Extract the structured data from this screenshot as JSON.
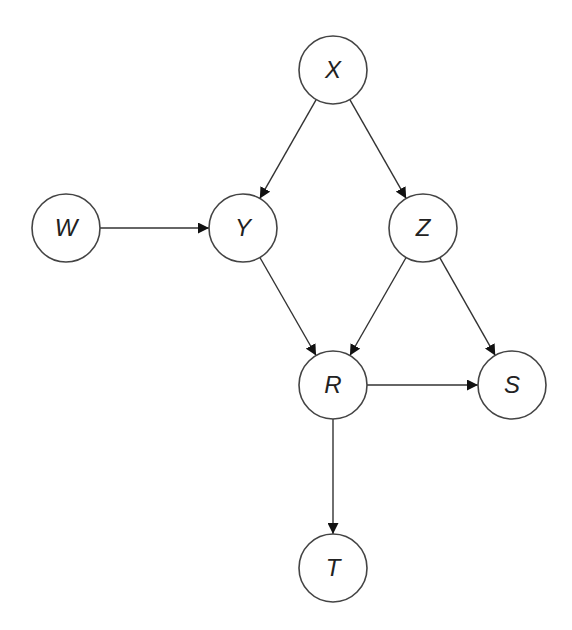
{
  "diagram": {
    "type": "directed-acyclic-graph",
    "node_radius": 34,
    "colors": {
      "node_stroke": "#444444",
      "node_fill": "#ffffff",
      "edge": "#333333",
      "label": "#222222"
    },
    "nodes": [
      {
        "id": "X",
        "label": "X",
        "cx": 333,
        "cy": 70
      },
      {
        "id": "W",
        "label": "W",
        "cx": 66,
        "cy": 228
      },
      {
        "id": "Y",
        "label": "Y",
        "cx": 243,
        "cy": 228
      },
      {
        "id": "Z",
        "label": "Z",
        "cx": 423,
        "cy": 228
      },
      {
        "id": "R",
        "label": "R",
        "cx": 333,
        "cy": 385
      },
      {
        "id": "S",
        "label": "S",
        "cx": 512,
        "cy": 385
      },
      {
        "id": "T",
        "label": "T",
        "cx": 333,
        "cy": 568
      }
    ],
    "edges": [
      {
        "from": "X",
        "to": "Y"
      },
      {
        "from": "X",
        "to": "Z"
      },
      {
        "from": "W",
        "to": "Y"
      },
      {
        "from": "Y",
        "to": "R"
      },
      {
        "from": "Z",
        "to": "R"
      },
      {
        "from": "Z",
        "to": "S"
      },
      {
        "from": "R",
        "to": "S"
      },
      {
        "from": "R",
        "to": "T"
      }
    ]
  }
}
